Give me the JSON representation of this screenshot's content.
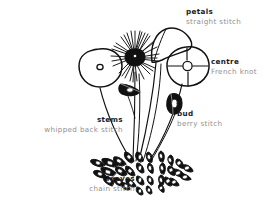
{
  "figure": {
    "kind": "embroidery-stitch-diagram",
    "background_color": "#ffffff",
    "ink_color": "#111111",
    "label_title_color": "#1b1b1b",
    "label_sub_color": "#8f8f8f"
  },
  "labels": {
    "petals": {
      "title": "petals",
      "sub": "straight stitch"
    },
    "centre": {
      "title": "centre",
      "sub": "French knot"
    },
    "bud": {
      "title": "bud",
      "sub": "berry stitch"
    },
    "stems": {
      "title": "stems",
      "sub": "whipped back stitch"
    },
    "leaves": {
      "title": "leaves",
      "sub": "chain stitch"
    }
  },
  "drawing_parts": [
    {
      "name": "round-flower-left",
      "description": "plain outlined circle with small French-knot centre"
    },
    {
      "name": "spiky-flower-centre",
      "description": "starburst of straight stitches radiating from a dark centre"
    },
    {
      "name": "fan-petal",
      "description": "large curved hood-shaped petal"
    },
    {
      "name": "quartered-flower",
      "description": "circle divided into four quarters with knot centre"
    },
    {
      "name": "bud-left",
      "description": "small pointed oval bud on short stem"
    },
    {
      "name": "bud-right",
      "description": "small pointed oval bud hanging from stem"
    },
    {
      "name": "stems",
      "description": "five long thin stems converging at the base"
    },
    {
      "name": "leaf-cluster",
      "description": "dense rosette of chain-stitch oval leaves at the base"
    }
  ]
}
